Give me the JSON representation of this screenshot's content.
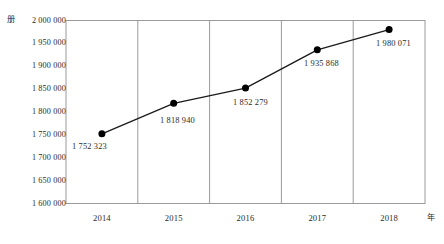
{
  "chart_data": {
    "type": "line",
    "title": "",
    "xlabel": "年",
    "ylabel": "册",
    "categories": [
      "2014",
      "2015",
      "2016",
      "2017",
      "2018"
    ],
    "values": [
      1752323,
      1818940,
      1852279,
      1935868,
      1980071
    ],
    "point_labels": [
      "1 752 323",
      "1 818 940",
      "1 852 279",
      "1 935 868",
      "1 980 071"
    ],
    "ylim": [
      1600000,
      2000000
    ],
    "ytick_values": [
      2000000,
      1950000,
      1900000,
      1850000,
      1800000,
      1750000,
      1700000,
      1650000,
      1600000
    ],
    "ytick_labels": [
      "2 000 000",
      "1 950 000",
      "1 900 000",
      "1 850 000",
      "1 800 000",
      "1 750 000",
      "1 700 000",
      "1 650 000",
      "1 600 000"
    ],
    "grid": {
      "vertical": true,
      "horizontal": false
    },
    "legend": {
      "visible": false,
      "position": "none"
    },
    "series": [
      {
        "name": "藏书量",
        "values": [
          1752323,
          1818940,
          1852279,
          1935868,
          1980071
        ],
        "line_color": "#1a1a1a",
        "marker": "circle",
        "marker_color": "#000000"
      }
    ],
    "colors": {
      "line": "#1a1a1a",
      "marker": "#000000",
      "axis": "#808080",
      "gridline": "#999999",
      "text": "#2b2b2b",
      "background": "#ffffff"
    }
  }
}
